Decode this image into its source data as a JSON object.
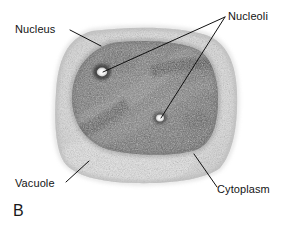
{
  "figure": {
    "panel_letter": "B",
    "background_color": "#ffffff",
    "label_color": "#141414",
    "line_color": "#111111"
  },
  "labels": {
    "nucleus": "Nucleus",
    "nucleoli": "Nucleoli",
    "vacuole": "Vacuole",
    "cytoplasm": "Cytoplasm"
  },
  "structures": {
    "cell_outline": {
      "name": "cell",
      "fill_color": "#d8d8d8"
    },
    "cytoplasm": {
      "name": "cytoplasm",
      "fill_color": "#dcdcdc"
    },
    "vacuole": {
      "name": "vacuole",
      "fill_color": "#e4e4e4"
    },
    "nucleus": {
      "name": "nucleus",
      "fill_color": "#6b6b6b"
    },
    "nucleolus_upper": {
      "name": "nucleolus",
      "fill_color": "#f2f2f2"
    },
    "nucleolus_lower": {
      "name": "nucleolus",
      "fill_color": "#f0f0f0"
    }
  }
}
